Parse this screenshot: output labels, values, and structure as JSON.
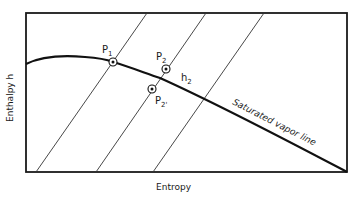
{
  "diagram": {
    "x_axis_label": "Entropy",
    "y_axis_label": "Enthalpy h",
    "curve_label": "Saturated vapor line",
    "points": [
      {
        "id": "P1",
        "label": "P",
        "sub": "1"
      },
      {
        "id": "P2",
        "label": "P",
        "sub": "2"
      },
      {
        "id": "P2prime",
        "label": "P",
        "sub": "2'"
      }
    ],
    "annotation": {
      "label": "h",
      "sub": "2"
    },
    "constant_pressure_lines": 3
  }
}
